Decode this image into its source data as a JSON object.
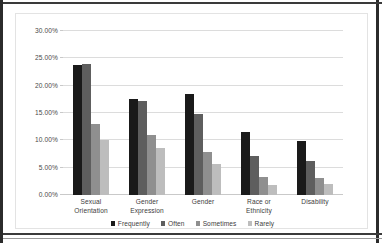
{
  "chart_data": {
    "type": "bar",
    "title": "",
    "xlabel": "",
    "ylabel": "",
    "ylim": [
      0,
      30
    ],
    "grid": true,
    "legend_position": "bottom",
    "y_ticks": [
      "0.00%",
      "5.00%",
      "10.00%",
      "15.00%",
      "20.00%",
      "25.00%",
      "30.00%"
    ],
    "y_tick_values": [
      0,
      5,
      10,
      15,
      20,
      25,
      30
    ],
    "categories": [
      "Sexual Orientation",
      "Gender Expression",
      "Gender",
      "Race or Ethnicity",
      "Disability"
    ],
    "category_lines": [
      [
        "Sexual",
        "Orientation"
      ],
      [
        "Gender",
        "Expression"
      ],
      [
        "Gender",
        ""
      ],
      [
        "Race or Ethnicity",
        ""
      ],
      [
        "Disability",
        ""
      ]
    ],
    "series": [
      {
        "name": "Frequently",
        "color": "#1a1a1a",
        "values": [
          23.7,
          17.5,
          18.4,
          11.6,
          9.8
        ]
      },
      {
        "name": "Often",
        "color": "#5e5e5e",
        "values": [
          24.0,
          17.2,
          14.9,
          7.1,
          6.3
        ]
      },
      {
        "name": "Sometimes",
        "color": "#8f8f8f",
        "values": [
          12.9,
          10.9,
          7.9,
          3.3,
          3.2
        ]
      },
      {
        "name": "Rarely",
        "color": "#bdbdbd",
        "values": [
          10.0,
          8.6,
          5.7,
          1.9,
          2.1
        ]
      }
    ]
  }
}
